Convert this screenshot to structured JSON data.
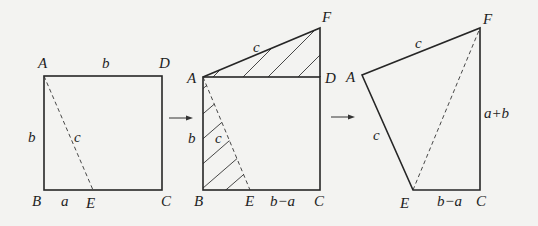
{
  "diagram": {
    "figure1": {
      "labels": {
        "A": "A",
        "B": "B",
        "C": "C",
        "D": "D",
        "E": "E",
        "top_side": "b",
        "left_side": "b",
        "diagonal": "c",
        "BE": "a"
      }
    },
    "figure2": {
      "labels": {
        "A": "A",
        "B": "B",
        "C": "C",
        "D": "D",
        "E": "E",
        "F": "F",
        "left_side": "b",
        "AE": "c",
        "AF": "c",
        "EC": "b−a"
      }
    },
    "figure3": {
      "labels": {
        "A": "A",
        "E": "E",
        "C": "C",
        "F": "F",
        "AF": "c",
        "AE": "c",
        "FC": "a+b",
        "EC": "b−a"
      }
    },
    "arrows": [
      "→",
      "→"
    ]
  }
}
